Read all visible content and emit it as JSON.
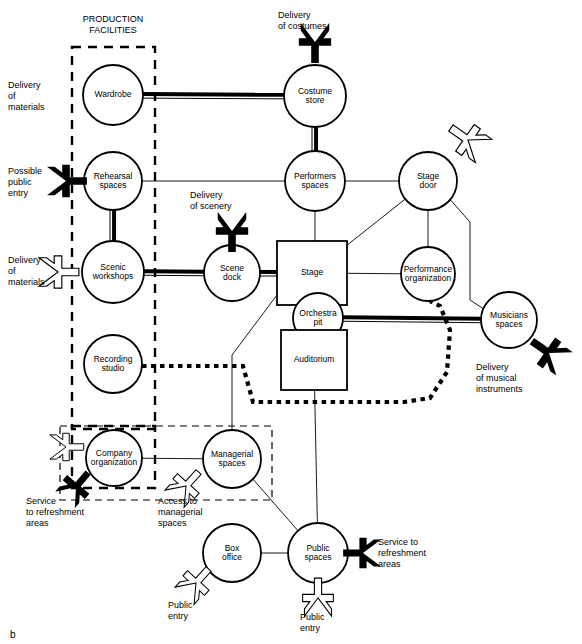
{
  "figure": {
    "caption": "b",
    "group_label_production": "PRODUCTION\nFACILITIES",
    "group_label_production_line1": "PRODUCTION",
    "group_label_production_line2": "FACILITIES"
  },
  "nodes": [
    {
      "id": "wardrobe",
      "label_lines": [
        "Wardrobe"
      ],
      "shape": "circle",
      "cx": 113,
      "cy": 95,
      "r": 30
    },
    {
      "id": "costume_store",
      "label_lines": [
        "Costume",
        "store"
      ],
      "shape": "circle",
      "cx": 315,
      "cy": 96,
      "r": 31
    },
    {
      "id": "rehearsal",
      "label_lines": [
        "Rehearsal",
        "spaces"
      ],
      "shape": "circle",
      "cx": 113,
      "cy": 181,
      "r": 29
    },
    {
      "id": "performers",
      "label_lines": [
        "Performers",
        "spaces"
      ],
      "shape": "circle",
      "cx": 315,
      "cy": 181,
      "r": 30
    },
    {
      "id": "stage_door",
      "label_lines": [
        "Stage",
        "door"
      ],
      "shape": "circle",
      "cx": 428,
      "cy": 181,
      "r": 29
    },
    {
      "id": "scenic",
      "label_lines": [
        "Scenic",
        "workshops"
      ],
      "shape": "circle",
      "cx": 113,
      "cy": 272,
      "r": 31
    },
    {
      "id": "scene_dock",
      "label_lines": [
        "Scene",
        "dock"
      ],
      "shape": "circle",
      "cx": 232,
      "cy": 273,
      "r": 28
    },
    {
      "id": "stage",
      "label_lines": [
        "Stage"
      ],
      "shape": "rect",
      "x": 277,
      "y": 241,
      "w": 70,
      "h": 64
    },
    {
      "id": "perf_org",
      "label_lines": [
        "Performance",
        "organization"
      ],
      "shape": "circle",
      "cx": 428,
      "cy": 274,
      "r": 27
    },
    {
      "id": "orchestra_pit",
      "label_lines": [
        "Orchestra",
        "pit"
      ],
      "shape": "circle",
      "cx": 318,
      "cy": 318,
      "r": 25
    },
    {
      "id": "musicians",
      "label_lines": [
        "Musicians",
        "spaces"
      ],
      "shape": "circle",
      "cx": 509,
      "cy": 320,
      "r": 28
    },
    {
      "id": "recording",
      "label_lines": [
        "Recording",
        "studio"
      ],
      "shape": "circle",
      "cx": 113,
      "cy": 364,
      "r": 29
    },
    {
      "id": "auditorium",
      "label_lines": [
        "Auditorium"
      ],
      "shape": "rect",
      "x": 281,
      "y": 330,
      "w": 66,
      "h": 60
    },
    {
      "id": "company_org",
      "label_lines": [
        "Company",
        "organization"
      ],
      "shape": "circle",
      "cx": 114,
      "cy": 458,
      "r": 28
    },
    {
      "id": "managerial",
      "label_lines": [
        "Managerial",
        "spaces"
      ],
      "shape": "circle",
      "cx": 232,
      "cy": 459,
      "r": 29
    },
    {
      "id": "box_office",
      "label_lines": [
        "Box",
        "office"
      ],
      "shape": "circle",
      "cx": 232,
      "cy": 553,
      "r": 29
    },
    {
      "id": "public_spaces",
      "label_lines": [
        "Public",
        "spaces"
      ],
      "shape": "circle",
      "cx": 318,
      "cy": 553,
      "r": 30
    }
  ],
  "links": [
    {
      "from": "wardrobe",
      "to": "costume_store",
      "style": "heavy"
    },
    {
      "from": "costume_store",
      "to": "performers",
      "style": "heavy"
    },
    {
      "from": "rehearsal",
      "to": "performers",
      "style": "thin"
    },
    {
      "from": "rehearsal",
      "to": "scenic",
      "style": "heavy"
    },
    {
      "from": "scenic",
      "to": "scene_dock",
      "style": "heavy"
    },
    {
      "from": "scene_dock",
      "to": "stage",
      "style": "heavy"
    },
    {
      "from": "performers",
      "to": "stage_door",
      "style": "thin"
    },
    {
      "from": "performers",
      "to": "stage",
      "style": "thin"
    },
    {
      "from": "stage_door",
      "to": "stage",
      "style": "thin"
    },
    {
      "from": "stage_door",
      "to": "perf_org",
      "style": "thin"
    },
    {
      "from": "stage_door",
      "to": "musicians",
      "style": "thin"
    },
    {
      "from": "stage",
      "to": "perf_org",
      "style": "thin"
    },
    {
      "from": "orchestra_pit",
      "to": "musicians",
      "style": "heavy"
    },
    {
      "from": "perf_org",
      "to": "recording",
      "style": "dotted"
    },
    {
      "from": "recording",
      "to": "perf_org",
      "style": "dotted"
    },
    {
      "from": "stage",
      "to": "managerial",
      "style": "thin"
    },
    {
      "from": "auditorium",
      "to": "public_spaces",
      "style": "thin"
    },
    {
      "from": "company_org",
      "to": "managerial",
      "style": "thin"
    },
    {
      "from": "managerial",
      "to": "public_spaces",
      "style": "thin"
    },
    {
      "from": "box_office",
      "to": "public_spaces",
      "style": "thin"
    }
  ],
  "external_labels": [
    {
      "id": "delivery-of-materials-top",
      "lines": [
        "Delivery",
        "of",
        "materials"
      ],
      "x": 8,
      "y": 80,
      "align": "left"
    },
    {
      "id": "delivery-of-costumes",
      "lines": [
        "Delivery",
        "of costumes"
      ],
      "x": 278,
      "y": 10,
      "align": "left"
    },
    {
      "id": "possible-public-entry",
      "lines": [
        "Possible",
        "public",
        "entry"
      ],
      "x": 8,
      "y": 166,
      "align": "left"
    },
    {
      "id": "delivery-of-scenery",
      "lines": [
        "Delivery",
        "of scenery"
      ],
      "x": 190,
      "y": 190,
      "align": "left"
    },
    {
      "id": "delivery-of-materials-bottom",
      "lines": [
        "Delivery",
        "of",
        "materials"
      ],
      "x": 8,
      "y": 255,
      "align": "left"
    },
    {
      "id": "delivery-of-musical-instruments",
      "lines": [
        "Delivery",
        "of musical",
        "instruments"
      ],
      "x": 476,
      "y": 362,
      "align": "left"
    },
    {
      "id": "service-to-refreshment-left",
      "lines": [
        "Service",
        "to refreshment",
        "areas"
      ],
      "x": 26,
      "y": 496,
      "align": "left"
    },
    {
      "id": "access-to-managerial-spaces",
      "lines": [
        "Access to",
        "managerial",
        "spaces"
      ],
      "x": 158,
      "y": 496,
      "align": "left"
    },
    {
      "id": "public-entry-box-office",
      "lines": [
        "Public",
        "entry"
      ],
      "x": 168,
      "y": 600,
      "align": "left"
    },
    {
      "id": "public-entry-public-spaces",
      "lines": [
        "Public",
        "entry"
      ],
      "x": 300,
      "y": 612,
      "align": "left"
    },
    {
      "id": "service-to-refreshment-right",
      "lines": [
        "Service to",
        "refreshment",
        "areas"
      ],
      "x": 378,
      "y": 537,
      "align": "left"
    }
  ],
  "groups": [
    {
      "id": "production-facilities",
      "label_lines": [
        "PRODUCTION",
        "FACILITIES"
      ],
      "x": 72,
      "y": 47,
      "w": 83,
      "h": 382,
      "style": "thick-dashed",
      "label_x": 113,
      "label_y": 22
    },
    {
      "id": "administration-area",
      "label_lines": [],
      "x": 60,
      "y": 426,
      "w": 212,
      "h": 74,
      "style": "thin-dashed"
    },
    {
      "id": "company-org-box",
      "label_lines": [],
      "x": 72,
      "y": 426,
      "w": 83,
      "h": 62,
      "style": "thick-dashed"
    }
  ],
  "arrows": [
    {
      "id": "arrow-delivery-of-costumes",
      "kind": "black",
      "x": 315,
      "y": 42,
      "angle": 90,
      "size": 1.0
    },
    {
      "id": "arrow-possible-public-entry",
      "kind": "black",
      "x": 66,
      "y": 181,
      "angle": 0,
      "size": 1.0
    },
    {
      "id": "arrow-delivery-of-materials",
      "kind": "white",
      "x": 58,
      "y": 272,
      "angle": 0,
      "size": 1.0
    },
    {
      "id": "arrow-delivery-of-scenery",
      "kind": "black",
      "x": 232,
      "y": 231,
      "angle": 90,
      "size": 1.0
    },
    {
      "id": "arrow-stage-door-entry",
      "kind": "white",
      "x": 468,
      "y": 140,
      "angle": 215,
      "size": 1.0
    },
    {
      "id": "arrow-delivery-musical-instr",
      "kind": "black",
      "x": 549,
      "y": 353,
      "angle": 215,
      "size": 1.0
    },
    {
      "id": "arrow-company-white",
      "kind": "white",
      "x": 66,
      "y": 447,
      "angle": 0,
      "size": 0.85
    },
    {
      "id": "arrow-service-refreshment-l",
      "kind": "black",
      "x": 76,
      "y": 487,
      "angle": 310,
      "size": 0.9
    },
    {
      "id": "arrow-access-managerial",
      "kind": "white",
      "x": 186,
      "y": 486,
      "angle": 312,
      "size": 0.9
    },
    {
      "id": "arrow-public-entry-box",
      "kind": "white",
      "x": 196,
      "y": 583,
      "angle": 312,
      "size": 0.9
    },
    {
      "id": "arrow-public-entry-public",
      "kind": "white",
      "x": 318,
      "y": 598,
      "angle": 270,
      "size": 0.95
    },
    {
      "id": "arrow-service-refreshment-r",
      "kind": "black",
      "x": 363,
      "y": 553,
      "angle": 180,
      "size": 0.95
    }
  ]
}
